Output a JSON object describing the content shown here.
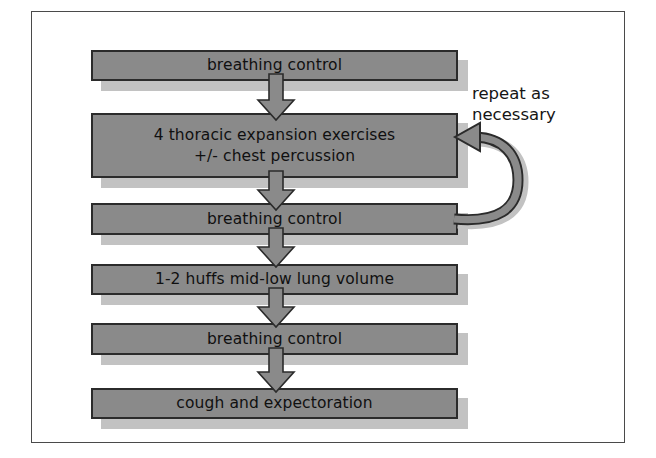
{
  "figure": {
    "background_color": "#ffffff",
    "frame_color": "#4a4a4a",
    "node_fill_color": "#8a8a8a",
    "node_border_color": "#2b2b2b",
    "shadow_color": "#c2c2c2",
    "arrow_fill_color": "#8a8a8a",
    "arrow_stroke_color": "#2b2b2b"
  },
  "nodes": [
    {
      "id": "breathing-control-1",
      "label": "breathing control"
    },
    {
      "id": "thoracic-expansion",
      "label": "4 thoracic expansion exercises\n+/- chest percussion"
    },
    {
      "id": "breathing-control-2",
      "label": "breathing control"
    },
    {
      "id": "huffs",
      "label": "1-2 huffs mid-low lung volume"
    },
    {
      "id": "breathing-control-3",
      "label": "breathing control"
    },
    {
      "id": "cough",
      "label": "cough and expectoration"
    }
  ],
  "connectors": [
    {
      "id": "arrow-1-2",
      "from": "breathing-control-1",
      "to": "thoracic-expansion"
    },
    {
      "id": "arrow-2-3",
      "from": "thoracic-expansion",
      "to": "breathing-control-2"
    },
    {
      "id": "arrow-3-4",
      "from": "breathing-control-2",
      "to": "huffs"
    },
    {
      "id": "arrow-4-5",
      "from": "huffs",
      "to": "breathing-control-3"
    },
    {
      "id": "arrow-5-6",
      "from": "breathing-control-3",
      "to": "cough"
    }
  ],
  "loop": {
    "id": "repeat-loop",
    "from": "breathing-control-2",
    "to": "thoracic-expansion",
    "caption": "repeat as\nnecessary"
  }
}
